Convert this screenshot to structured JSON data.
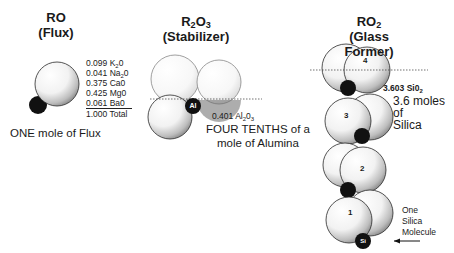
{
  "columns": [
    {
      "id": "ro",
      "formula": "RO",
      "role": "(Flux)",
      "caption": "ONE mole of Flux",
      "composition": [
        {
          "amount": "0.099",
          "oxide": "K",
          "sub": "2",
          "rest": "0"
        },
        {
          "amount": "0.041",
          "oxide": "Na",
          "sub": "2",
          "rest": "0"
        },
        {
          "amount": "0.375",
          "oxide": "Ca0",
          "sub": "",
          "rest": ""
        },
        {
          "amount": "0.425",
          "oxide": "Mg0",
          "sub": "",
          "rest": ""
        },
        {
          "amount": "0.061",
          "oxide": "Ba0",
          "sub": "",
          "rest": ""
        },
        {
          "amount": "1.000",
          "oxide": "Total",
          "sub": "",
          "rest": ""
        }
      ]
    },
    {
      "id": "r2o3",
      "formula_parts": [
        "R",
        "2",
        "O",
        "3"
      ],
      "role": "(Stabilizer)",
      "atom_label": "Al",
      "amount": "0.401",
      "oxide_parts": [
        "Al",
        "2",
        "0",
        "3"
      ],
      "caption_line1": "FOUR TENTHS of a",
      "caption_line2": "mole of Alumina"
    },
    {
      "id": "ro2",
      "formula_parts": [
        "RO",
        "2"
      ],
      "role": "(Glass Former)",
      "amount": "3.603",
      "oxide_parts": [
        "Si0",
        "2"
      ],
      "caption_lines": [
        "3.6 moles",
        "of",
        "Silica"
      ],
      "molecule_numbers": [
        "4",
        "3",
        "2",
        "1"
      ],
      "atom_label": "Si",
      "arrow_label_lines": [
        "One",
        "Silica",
        "Molecule"
      ]
    }
  ],
  "colors": {
    "sphere_edge": "#2a2a2a",
    "atom_fill": "#111111",
    "dotted_line": "#333333"
  }
}
